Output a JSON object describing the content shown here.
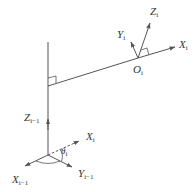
{
  "diagram": {
    "type": "coordinate-frame-link-diagram",
    "colors": {
      "line": "#555555",
      "text": "#333333",
      "background": "#ffffff"
    },
    "frames": {
      "upper": {
        "origin_label": {
          "main": "O",
          "sub": "i"
        },
        "axes": [
          {
            "main": "X",
            "sub": "i"
          },
          {
            "main": "Y",
            "sub": "i"
          },
          {
            "main": "Z",
            "sub": "i"
          }
        ]
      },
      "lower": {
        "axes": [
          {
            "main": "Z",
            "sub": "i−1"
          },
          {
            "main": "X",
            "sub": "i−1"
          },
          {
            "main": "Y",
            "sub": "i−1"
          }
        ],
        "projected_axis": {
          "main": "X",
          "sub": "i"
        },
        "angle": {
          "main": "θ",
          "sub": "i"
        }
      }
    },
    "annotations": [
      "right-angle marker at common normal / Z_{i-1} intersection",
      "right-angle marker at O_i between X_i and Z_i"
    ]
  }
}
